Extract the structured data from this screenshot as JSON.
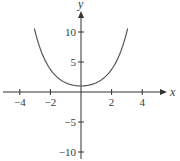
{
  "chart_data": {
    "type": "line",
    "title": "",
    "xlabel": "x",
    "ylabel": "y",
    "function": "y = cosh(x)",
    "xlim": [
      -5.2,
      5.5
    ],
    "ylim": [
      -10.5,
      13
    ],
    "x_ticks": [
      -4,
      -2,
      2,
      4
    ],
    "x_tick_labels": [
      "−4",
      "−2",
      "2",
      "4"
    ],
    "y_ticks": [
      10,
      5,
      -5,
      -10
    ],
    "y_tick_labels": [
      "10",
      "5",
      "−5",
      "−10"
    ],
    "grid": false,
    "legend": null,
    "series": [
      {
        "name": "cosh(x)",
        "x": [
          -3,
          -2.5,
          -2,
          -1.5,
          -1,
          -0.5,
          0,
          0.5,
          1,
          1.5,
          2,
          2.5,
          3
        ],
        "values": [
          10.07,
          6.13,
          3.76,
          2.35,
          1.54,
          1.13,
          1.0,
          1.13,
          1.54,
          2.35,
          3.76,
          6.13,
          10.07
        ]
      }
    ],
    "colors": {
      "curve": "#555555",
      "axes": "#333333"
    }
  }
}
